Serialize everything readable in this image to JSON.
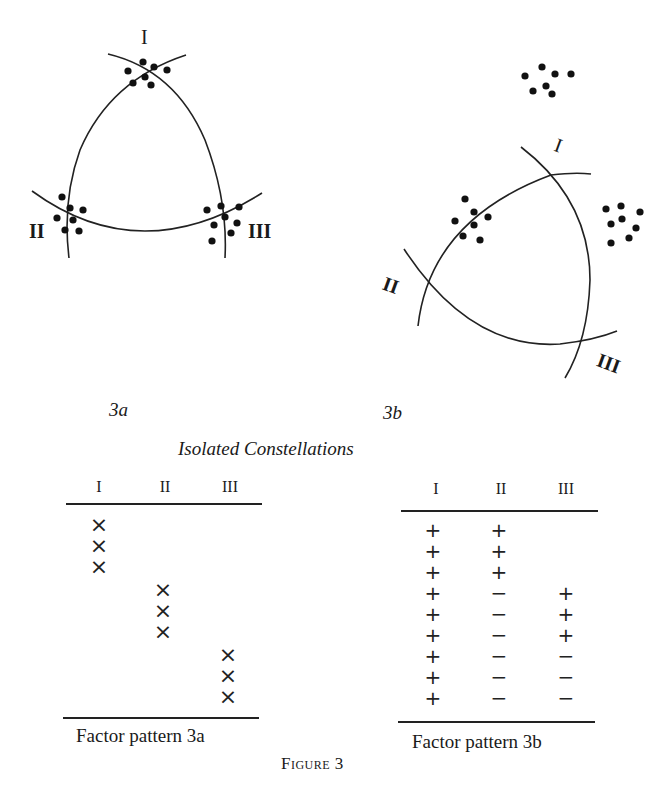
{
  "figure": {
    "panel_a": {
      "label": "3a",
      "factor_labels": [
        "I",
        "II",
        "III"
      ]
    },
    "panel_b": {
      "label": "3b",
      "factor_labels": [
        "I",
        "II",
        "III"
      ]
    },
    "section_title": "Isolated Constellations",
    "caption": "Figure 3"
  },
  "table_a": {
    "caption": "Factor pattern 3a",
    "headers": [
      "I",
      "II",
      "III"
    ],
    "rows": [
      [
        "×",
        "",
        ""
      ],
      [
        "×",
        "",
        ""
      ],
      [
        "×",
        "",
        ""
      ],
      [
        "",
        "×",
        ""
      ],
      [
        "",
        "×",
        ""
      ],
      [
        "",
        "×",
        ""
      ],
      [
        "",
        "",
        "×"
      ],
      [
        "",
        "",
        "×"
      ],
      [
        "",
        "",
        "×"
      ]
    ]
  },
  "table_b": {
    "caption": "Factor pattern 3b",
    "headers": [
      "I",
      "II",
      "III"
    ],
    "rows": [
      [
        "+",
        "+",
        ""
      ],
      [
        "+",
        "+",
        ""
      ],
      [
        "+",
        "+",
        ""
      ],
      [
        "+",
        "−",
        "+"
      ],
      [
        "+",
        "−",
        "+"
      ],
      [
        "+",
        "−",
        "+"
      ],
      [
        "+",
        "−",
        "−"
      ],
      [
        "+",
        "−",
        "−"
      ],
      [
        "+",
        "−",
        "−"
      ]
    ]
  }
}
